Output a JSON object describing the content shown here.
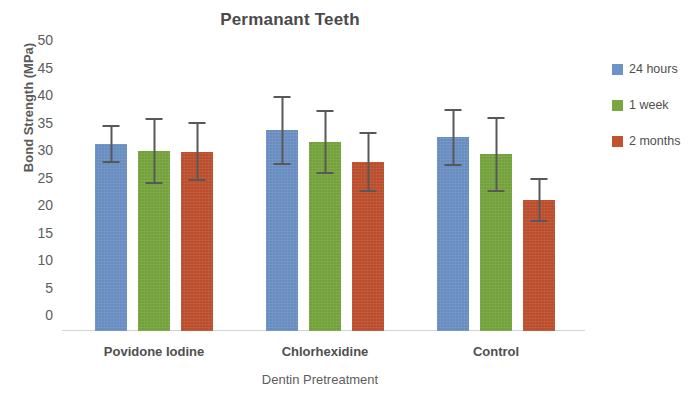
{
  "chart_data": {
    "type": "bar",
    "title": "Permanant Teeth",
    "xlabel": "Dentin Pretreatment",
    "ylabel": "Bond Strength (MPa)",
    "ylim": [
      0,
      50
    ],
    "yticks": [
      50,
      45,
      40,
      35,
      30,
      25,
      20,
      15,
      10,
      5,
      0
    ],
    "grid": false,
    "legend_position": "right",
    "error_bars": "symmetric",
    "categories": [
      "Povidone Iodine",
      "Chlorhexidine",
      "Control"
    ],
    "series": [
      {
        "name": "24 hours",
        "color": "#6d93c9",
        "values": [
          34.0,
          36.5,
          35.2
        ],
        "errors": [
          3.5,
          6.3,
          5.2
        ]
      },
      {
        "name": "1 week",
        "color": "#79a83e",
        "values": [
          32.7,
          34.4,
          32.1
        ],
        "errors": [
          6.0,
          5.8,
          6.8
        ]
      },
      {
        "name": "2 months",
        "color": "#c2512e",
        "values": [
          32.6,
          30.7,
          23.8
        ],
        "errors": [
          5.4,
          5.5,
          4.0
        ]
      }
    ]
  },
  "legend": {
    "items": [
      {
        "label": "24 hours",
        "color": "#6d93c9"
      },
      {
        "label": "1 week",
        "color": "#79a83e"
      },
      {
        "label": "2 months",
        "color": "#c2512e"
      }
    ]
  }
}
